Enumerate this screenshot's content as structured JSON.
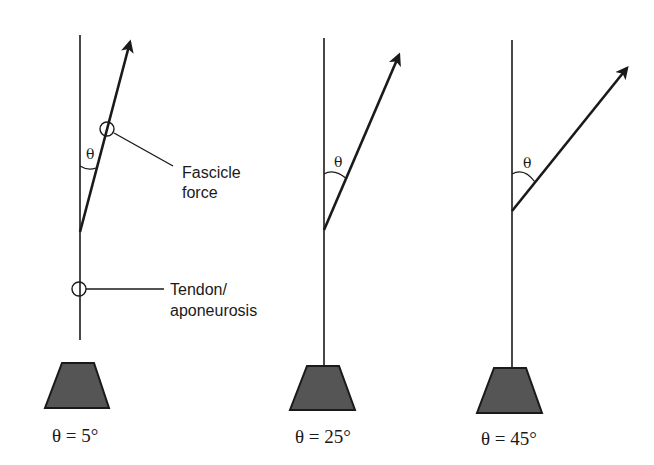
{
  "figure": {
    "panels": [
      {
        "id": "panel-5deg",
        "caption": "θ = 5°",
        "angle_label": "θ",
        "angle_deg": 5
      },
      {
        "id": "panel-25deg",
        "caption": "θ = 25°",
        "angle_label": "θ",
        "angle_deg": 25
      },
      {
        "id": "panel-45deg",
        "caption": "θ = 45°",
        "angle_label": "θ",
        "angle_deg": 45
      }
    ],
    "annotations": {
      "fascicle_line1": "Fascicle",
      "fascicle_line2": "force",
      "tendon_line1": "Tendon/",
      "tendon_line2": "aponeurosis"
    },
    "colors": {
      "line": "#1a1a1a",
      "weight_fill": "#555555"
    }
  }
}
